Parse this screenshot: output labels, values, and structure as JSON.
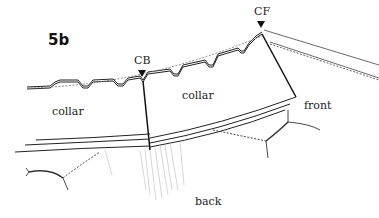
{
  "figure": {
    "number": "5b"
  },
  "markers": {
    "center_back": "CB",
    "center_front": "CF"
  },
  "labels": {
    "collar_left": "collar",
    "collar_right": "collar",
    "front": "front",
    "back": "back"
  },
  "colors": {
    "line": "#222222",
    "background": "#ffffff",
    "hatch": "#bbbbbb"
  }
}
